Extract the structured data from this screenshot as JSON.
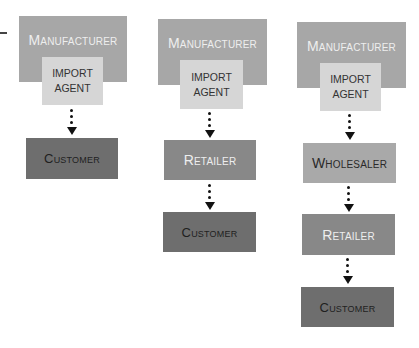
{
  "diagram": {
    "type": "distribution-channels",
    "colors": {
      "manufacturer": "#a7a7a7",
      "import_agent": "#d6d6d6",
      "wholesaler": "#a9a9a9",
      "retailer": "#888888",
      "customer": "#6e6e6e",
      "arrow": "#111111"
    },
    "channels": [
      {
        "manufacturer": "Manufacturer",
        "import_agent_line1": "IMPORT",
        "import_agent_line2": "AGENT",
        "customer": "Customer"
      },
      {
        "manufacturer": "Manufacturer",
        "import_agent_line1": "IMPORT",
        "import_agent_line2": "AGENT",
        "retailer": "Retailer",
        "customer": "Customer"
      },
      {
        "manufacturer": "Manufacturer",
        "import_agent_line1": "IMPORT",
        "import_agent_line2": "AGENT",
        "wholesaler": "Wholesaler",
        "retailer": "Retailer",
        "customer": "Customer"
      }
    ]
  }
}
